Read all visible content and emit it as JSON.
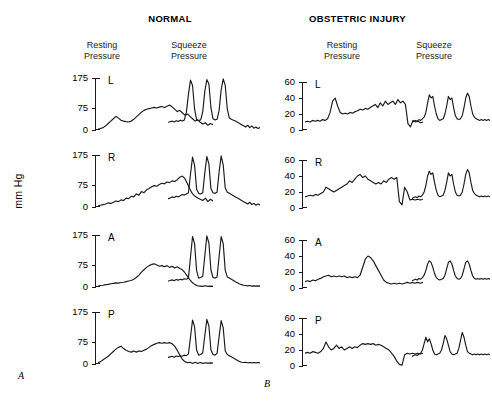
{
  "figure": {
    "panel_a_letter": "A",
    "panel_b_letter": "B",
    "y_axis_label": "mm Hg"
  },
  "panels": [
    {
      "id": "normal",
      "title": "NORMAL",
      "columns": [
        {
          "id": "resting",
          "line1": "Resting",
          "line2": "Pressure"
        },
        {
          "id": "squeeze",
          "line1": "Squeeze",
          "line2": "Pressure"
        }
      ],
      "y_ticks": [
        "175",
        "75",
        "0"
      ],
      "rows": [
        {
          "label": "L"
        },
        {
          "label": "R"
        },
        {
          "label": "A"
        },
        {
          "label": "P"
        }
      ]
    },
    {
      "id": "obstetric",
      "title": "OBSTETRIC INJURY",
      "columns": [
        {
          "id": "resting",
          "line1": "Resting",
          "line2": "Pressure"
        },
        {
          "id": "squeeze",
          "line1": "Squeeze",
          "line2": "Pressure"
        }
      ],
      "y_ticks": [
        "60",
        "40",
        "20",
        "0"
      ],
      "rows": [
        {
          "label": "L"
        },
        {
          "label": "R"
        },
        {
          "label": "A"
        },
        {
          "label": "P"
        }
      ]
    }
  ],
  "chart_data": {
    "type": "line",
    "ylabel": "mm Hg",
    "line_color": "#1a1a1a",
    "panels": [
      {
        "id": "normal",
        "letter": "A",
        "title": "NORMAL",
        "ylim": [
          0,
          175
        ],
        "yticks": [
          0,
          75,
          175
        ],
        "grid": false,
        "traces": [
          {
            "row": "L",
            "column": "Resting Pressure",
            "peak_mmhg": 85,
            "baseline_mmhg": 5,
            "values": [
              3,
              5,
              8,
              14,
              22,
              30,
              38,
              46,
              40,
              33,
              30,
              28,
              27,
              30,
              36,
              44,
              52,
              60,
              66,
              70,
              72,
              74,
              76,
              74,
              77,
              79,
              76,
              80,
              84,
              78,
              70,
              62,
              66,
              58,
              50,
              54,
              46,
              38,
              30,
              34,
              26,
              20,
              24,
              16,
              22,
              18
            ]
          },
          {
            "row": "L",
            "column": "Squeeze Pressure",
            "peak_mmhg": 170,
            "baseline_mmhg": 28,
            "values": [
              26,
              28,
              30,
              27,
              31,
              29,
              33,
              30,
              34,
              60,
              120,
              168,
              150,
              70,
              35,
              32,
              34,
              62,
              130,
              170,
              155,
              75,
              38,
              34,
              36,
              66,
              135,
              172,
              150,
              70,
              40,
              36,
              33,
              30,
              26,
              22,
              18,
              14,
              10,
              16,
              8,
              14,
              6,
              10,
              5,
              8
            ]
          },
          {
            "row": "R",
            "column": "Resting Pressure",
            "peak_mmhg": 105,
            "baseline_mmhg": 5,
            "values": [
              4,
              6,
              8,
              10,
              14,
              12,
              16,
              20,
              18,
              24,
              22,
              30,
              28,
              36,
              34,
              44,
              40,
              52,
              48,
              58,
              62,
              68,
              72,
              70,
              76,
              80,
              78,
              84,
              82,
              88,
              86,
              92,
              100,
              104,
              96,
              78,
              60,
              44,
              36,
              30,
              26,
              22,
              30,
              18,
              26,
              20
            ]
          },
          {
            "row": "R",
            "column": "Squeeze Pressure",
            "peak_mmhg": 172,
            "baseline_mmhg": 30,
            "values": [
              28,
              30,
              34,
              32,
              36,
              34,
              38,
              42,
              40,
              44,
              48,
              110,
              168,
              140,
              60,
              46,
              44,
              48,
              115,
              170,
              145,
              62,
              48,
              46,
              50,
              118,
              172,
              142,
              64,
              50,
              46,
              42,
              38,
              34,
              30,
              26,
              22,
              18,
              14,
              10,
              16,
              8,
              12,
              6,
              10,
              7
            ]
          },
          {
            "row": "A",
            "column": "Resting Pressure",
            "peak_mmhg": 80,
            "baseline_mmhg": 4,
            "values": [
              3,
              5,
              6,
              8,
              9,
              11,
              12,
              14,
              13,
              15,
              16,
              18,
              20,
              22,
              26,
              32,
              40,
              50,
              58,
              66,
              72,
              76,
              78,
              74,
              70,
              72,
              68,
              72,
              66,
              70,
              64,
              68,
              62,
              58,
              48,
              36,
              24,
              14,
              8,
              4,
              3,
              2,
              4,
              2,
              3,
              2
            ]
          },
          {
            "row": "A",
            "column": "Squeeze Pressure",
            "peak_mmhg": 172,
            "baseline_mmhg": 22,
            "values": [
              20,
              22,
              24,
              21,
              25,
              23,
              26,
              24,
              28,
              26,
              30,
              100,
              170,
              145,
              55,
              30,
              32,
              36,
              105,
              172,
              148,
              58,
              32,
              30,
              34,
              102,
              170,
              146,
              56,
              34,
              30,
              26,
              22,
              18,
              14,
              10,
              8,
              6,
              5,
              4,
              5,
              3,
              4,
              3,
              4,
              3
            ]
          },
          {
            "row": "P",
            "column": "Resting Pressure",
            "peak_mmhg": 78,
            "baseline_mmhg": 3,
            "values": [
              4,
              8,
              14,
              20,
              26,
              34,
              42,
              50,
              56,
              60,
              52,
              46,
              42,
              40,
              44,
              40,
              44,
              42,
              46,
              50,
              56,
              62,
              66,
              70,
              72,
              70,
              72,
              70,
              72,
              68,
              60,
              46,
              30,
              16,
              8,
              4,
              6,
              2,
              6,
              2,
              5,
              2,
              4,
              3,
              4,
              3
            ]
          },
          {
            "row": "P",
            "column": "Squeeze Pressure",
            "peak_mmhg": 150,
            "baseline_mmhg": 24,
            "values": [
              22,
              24,
              26,
              23,
              27,
              25,
              28,
              26,
              30,
              28,
              34,
              90,
              148,
              125,
              46,
              30,
              32,
              38,
              95,
              150,
              128,
              48,
              32,
              30,
              36,
              92,
              146,
              122,
              44,
              32,
              28,
              24,
              20,
              16,
              12,
              8,
              6,
              5,
              6,
              4,
              5,
              4,
              5,
              4,
              5,
              4
            ]
          }
        ]
      },
      {
        "id": "obstetric",
        "letter": "B",
        "title": "OBSTETRIC INJURY",
        "ylim": [
          0,
          60
        ],
        "yticks": [
          0,
          20,
          40,
          60
        ],
        "grid": false,
        "traces": [
          {
            "row": "L",
            "column": "Resting Pressure",
            "peak_mmhg": 41,
            "baseline_mmhg": 10,
            "values": [
              10,
              11,
              10,
              12,
              11,
              12,
              11,
              13,
              12,
              14,
              22,
              36,
              40,
              30,
              22,
              20,
              21,
              20,
              22,
              21,
              23,
              24,
              26,
              25,
              27,
              26,
              28,
              30,
              32,
              28,
              34,
              30,
              36,
              32,
              34,
              36,
              32,
              38,
              34,
              36,
              32,
              8,
              4,
              12,
              10,
              11,
              9,
              10
            ]
          },
          {
            "row": "L",
            "column": "Squeeze Pressure",
            "peak_mmhg": 46,
            "baseline_mmhg": 12,
            "values": [
              10,
              11,
              12,
              11,
              13,
              12,
              14,
              16,
              22,
              34,
              44,
              40,
              42,
              30,
              20,
              14,
              12,
              13,
              14,
              20,
              30,
              42,
              38,
              40,
              28,
              18,
              14,
              13,
              14,
              18,
              28,
              40,
              46,
              42,
              30,
              20,
              16,
              14,
              13,
              12,
              13,
              12,
              13,
              12,
              13,
              12
            ]
          },
          {
            "row": "R",
            "column": "Resting Pressure",
            "peak_mmhg": 44,
            "baseline_mmhg": 12,
            "values": [
              14,
              15,
              16,
              15,
              17,
              16,
              18,
              20,
              26,
              24,
              22,
              20,
              22,
              24,
              26,
              28,
              30,
              34,
              32,
              36,
              40,
              42,
              38,
              40,
              36,
              34,
              32,
              30,
              32,
              30,
              34,
              32,
              36,
              38,
              36,
              38,
              8,
              4,
              26,
              20,
              10,
              11,
              10,
              11,
              10,
              11
            ]
          },
          {
            "row": "R",
            "column": "Squeeze Pressure",
            "peak_mmhg": 48,
            "baseline_mmhg": 14,
            "values": [
              12,
              13,
              14,
              13,
              15,
              14,
              16,
              20,
              28,
              40,
              46,
              42,
              44,
              32,
              22,
              16,
              14,
              15,
              16,
              22,
              32,
              44,
              40,
              42,
              30,
              20,
              16,
              15,
              16,
              20,
              30,
              42,
              48,
              44,
              32,
              22,
              18,
              16,
              15,
              14,
              15,
              14,
              15,
              14,
              15,
              14
            ]
          },
          {
            "row": "A",
            "column": "Resting Pressure",
            "peak_mmhg": 40,
            "baseline_mmhg": 8,
            "values": [
              8,
              9,
              8,
              10,
              9,
              11,
              12,
              14,
              15,
              16,
              14,
              15,
              14,
              15,
              14,
              15,
              13,
              14,
              13,
              14,
              13,
              16,
              26,
              36,
              40,
              38,
              34,
              28,
              22,
              16,
              10,
              7,
              6,
              5,
              6,
              5,
              6,
              5,
              6,
              7,
              6,
              7,
              6,
              7,
              6,
              7
            ]
          },
          {
            "row": "A",
            "column": "Squeeze Pressure",
            "peak_mmhg": 34,
            "baseline_mmhg": 10,
            "values": [
              9,
              10,
              11,
              10,
              12,
              11,
              13,
              16,
              22,
              30,
              34,
              32,
              26,
              18,
              13,
              11,
              10,
              11,
              12,
              16,
              24,
              32,
              34,
              30,
              22,
              15,
              12,
              11,
              12,
              16,
              24,
              32,
              34,
              30,
              22,
              15,
              12,
              11,
              12,
              11,
              12,
              11,
              12,
              11,
              12,
              11
            ]
          },
          {
            "row": "P",
            "column": "Resting Pressure",
            "peak_mmhg": 30,
            "baseline_mmhg": 14,
            "values": [
              16,
              17,
              16,
              18,
              17,
              16,
              18,
              22,
              30,
              24,
              20,
              22,
              26,
              22,
              24,
              20,
              22,
              24,
              22,
              24,
              23,
              26,
              28,
              27,
              28,
              27,
              28,
              26,
              27,
              26,
              24,
              22,
              20,
              16,
              12,
              6,
              2,
              1,
              14,
              16,
              15,
              16,
              15,
              16,
              15,
              16
            ]
          },
          {
            "row": "P",
            "column": "Squeeze Pressure",
            "peak_mmhg": 42,
            "baseline_mmhg": 14,
            "values": [
              12,
              13,
              14,
              13,
              15,
              16,
              20,
              28,
              36,
              30,
              34,
              28,
              20,
              15,
              14,
              15,
              16,
              20,
              28,
              38,
              34,
              26,
              18,
              15,
              14,
              15,
              16,
              22,
              32,
              42,
              36,
              26,
              18,
              16,
              15,
              14,
              15,
              14,
              15,
              14,
              15,
              14,
              15,
              14,
              15,
              14
            ]
          }
        ]
      }
    ]
  }
}
